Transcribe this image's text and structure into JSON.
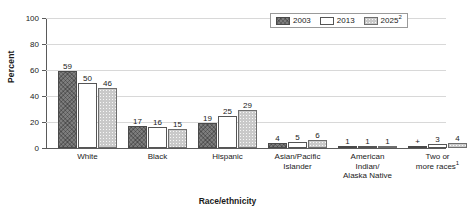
{
  "chart_data": {
    "type": "bar",
    "title": "",
    "xlabel": "Race/ethnicity",
    "ylabel": "Percent",
    "ylim": [
      0,
      100
    ],
    "yticks": [
      0,
      20,
      40,
      60,
      80,
      100
    ],
    "grid": true,
    "legend_position": "top-right",
    "categories": [
      "White",
      "Black",
      "Hispanic",
      "Asian/Pacific Islander",
      "American Indian/ Alaska Native",
      "Two or more races"
    ],
    "category_lines": [
      [
        "White"
      ],
      [
        "Black"
      ],
      [
        "Hispanic"
      ],
      [
        "Asian/Pacific",
        "Islander"
      ],
      [
        "American",
        "Indian/",
        "Alaska Native"
      ],
      [
        "Two or",
        "more races"
      ]
    ],
    "category_footnotes": [
      "",
      "",
      "",
      "",
      "",
      "1"
    ],
    "series": [
      {
        "name": "2003",
        "values": [
          59,
          17,
          19,
          4,
          1,
          0
        ],
        "labels": [
          "59",
          "17",
          "19",
          "4",
          "1",
          "+"
        ],
        "color": "#7d7d7d"
      },
      {
        "name": "2013",
        "values": [
          50,
          16,
          25,
          5,
          1,
          3
        ],
        "labels": [
          "50",
          "16",
          "25",
          "5",
          "1",
          "3"
        ],
        "color": "#ffffff"
      },
      {
        "name": "2025",
        "values": [
          46,
          15,
          29,
          6,
          1,
          4
        ],
        "labels": [
          "46",
          "15",
          "29",
          "6",
          "1",
          "4"
        ],
        "color": "#c9c9c9"
      }
    ],
    "legend_entries": [
      {
        "label": "2003",
        "footnote": ""
      },
      {
        "label": "2013",
        "footnote": ""
      },
      {
        "label": "2025",
        "footnote": "2"
      }
    ]
  }
}
